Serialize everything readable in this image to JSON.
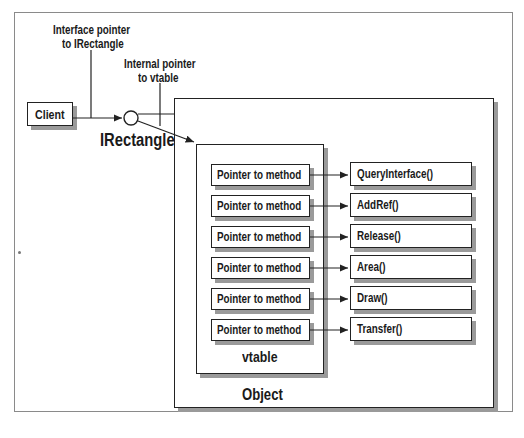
{
  "diagram": {
    "labels": {
      "interface_pointer": [
        "Interface pointer",
        "to IRectangle"
      ],
      "internal_pointer": [
        "Internal pointer",
        "to vtable"
      ],
      "interface_name": "IRectangle",
      "client": "Client",
      "vtable": "vtable",
      "object": "Object"
    },
    "vtable_entries": [
      {
        "slot": "Pointer to method",
        "method": "QueryInterface()"
      },
      {
        "slot": "Pointer to method",
        "method": "AddRef()"
      },
      {
        "slot": "Pointer to method",
        "method": "Release()"
      },
      {
        "slot": "Pointer to method",
        "method": "Area()"
      },
      {
        "slot": "Pointer to method",
        "method": "Draw()"
      },
      {
        "slot": "Pointer to method",
        "method": "Transfer()"
      }
    ],
    "colors": {
      "line": "#222222",
      "shadow": "#9a9a9a",
      "frame": "#8a8a8a"
    }
  }
}
